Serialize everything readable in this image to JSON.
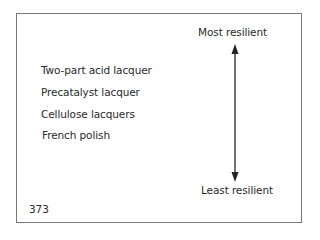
{
  "scale": {
    "top_label": "Most resilient",
    "bottom_label": "Least resilient"
  },
  "items": [
    "Two-part acid lacquer",
    "Precatalyst lacquer",
    "Cellulose lacquers",
    "French polish"
  ],
  "page_number": "373"
}
